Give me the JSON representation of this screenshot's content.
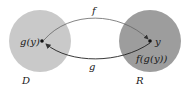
{
  "diagram": {
    "domain_set": {
      "label": "D",
      "color": "#c8c8c8"
    },
    "range_set": {
      "label": "R",
      "color": "#9c9c9c"
    },
    "points": {
      "left": {
        "label": "g(y)"
      },
      "right_top": {
        "label": "y"
      },
      "right_bottom": {
        "label": "f(g(y))"
      }
    },
    "arrows": {
      "top": {
        "label": "f"
      },
      "bottom": {
        "label": "g"
      }
    }
  }
}
